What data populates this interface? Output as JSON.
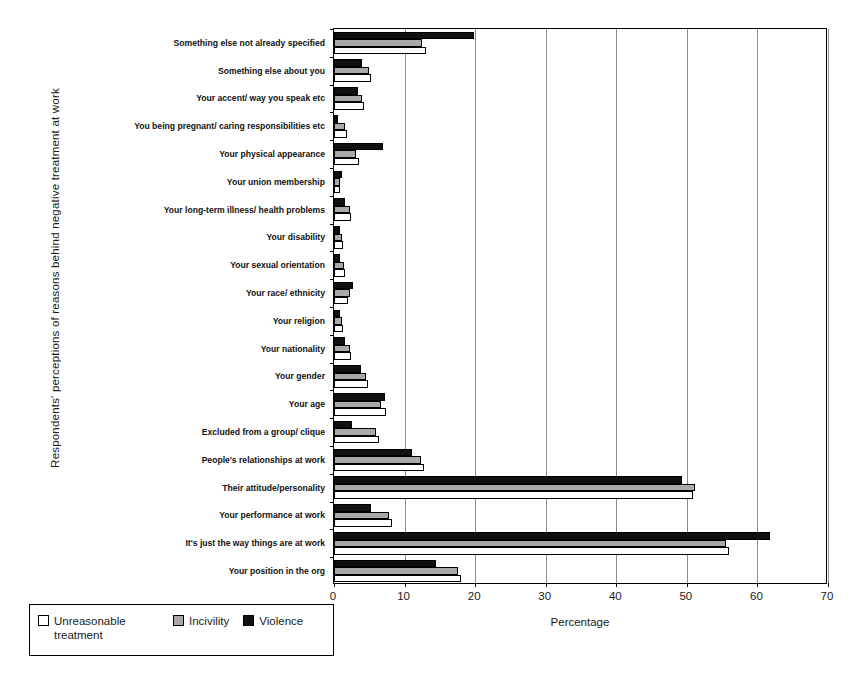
{
  "chart_data": {
    "type": "bar",
    "orientation": "horizontal",
    "title": "",
    "xlabel": "Percentage",
    "ylabel": "Respondents' perceptions of reasons behind negative treatment at work",
    "xlim": [
      0,
      70
    ],
    "xticks": [
      0,
      10,
      20,
      30,
      40,
      50,
      60,
      70
    ],
    "grid": "vertical",
    "legend_position": "bottom-left",
    "colors": {
      "unreasonable_treatment": "#ffffff",
      "incivility": "#a9a9a9",
      "violence": "#111111",
      "outline": "#000000",
      "gridline": "#8c8c8c"
    },
    "categories": [
      "Something else not already specified",
      "Something else about you",
      "Your accent/ way you speak etc",
      "You being pregnant/ caring responsibilities etc",
      "Your physical appearance",
      "Your union membership",
      "Your long-term illness/ health problems",
      "Your disability",
      "Your sexual orientation",
      "Your race/ ethnicity",
      "Your religion",
      "Your nationality",
      "Your gender",
      "Your age",
      "Excluded from a group/ clique",
      "People's relationships at work",
      "Their attitude/personality",
      "Your performance at work",
      "It's just the way things are at work",
      "Your position in the org"
    ],
    "series": [
      {
        "name": "Violence",
        "key": "violence",
        "values": [
          19.9,
          4.0,
          3.4,
          0.6,
          7.0,
          1.1,
          1.6,
          0.9,
          0.8,
          2.7,
          0.8,
          1.5,
          3.8,
          7.2,
          2.5,
          11.0,
          49.3,
          5.3,
          61.8,
          14.5
        ]
      },
      {
        "name": "Incivility",
        "key": "incivility",
        "values": [
          12.5,
          5.0,
          4.0,
          1.6,
          3.1,
          0.9,
          2.2,
          1.2,
          1.4,
          2.3,
          1.2,
          2.2,
          4.6,
          6.6,
          6.0,
          12.3,
          51.2,
          7.8,
          55.5,
          17.5
        ]
      },
      {
        "name": "Unreasonable treatment",
        "key": "unreasonable",
        "values": [
          13.1,
          5.2,
          4.2,
          1.9,
          3.5,
          0.8,
          2.4,
          1.3,
          1.5,
          2.0,
          1.3,
          2.4,
          4.8,
          7.4,
          6.4,
          12.8,
          50.8,
          8.2,
          56.0,
          18.0
        ]
      }
    ]
  },
  "legend": {
    "items": [
      {
        "label": "Unreasonable treatment",
        "key": "unreasonable"
      },
      {
        "label": "Incivility",
        "key": "incivility"
      },
      {
        "label": "Violence",
        "key": "violence"
      }
    ]
  }
}
